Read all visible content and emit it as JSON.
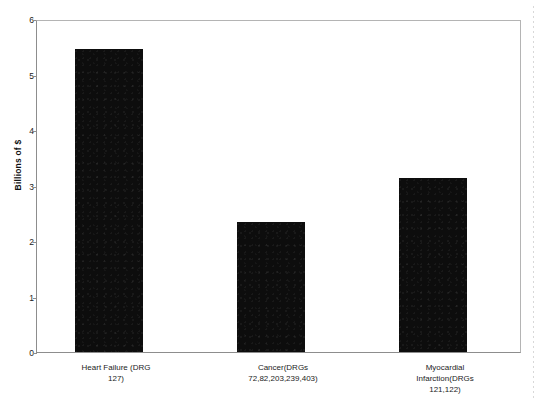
{
  "chart_data": {
    "type": "bar",
    "title": "",
    "subtitle": "",
    "xlabel": "",
    "ylabel": "Billions of $",
    "ylim": [
      0,
      6
    ],
    "yticks": [
      "0",
      "1",
      "2",
      "3",
      "4",
      "5",
      "6"
    ],
    "grid": false,
    "legend": null,
    "categories": [
      "Heart Failure (DRG\n127)",
      "Cancer(DRGs\n72,82,203,239,403)",
      "Myocardial\nInfarction(DRGs\n121,122)"
    ],
    "values": [
      5.5,
      2.35,
      3.15
    ],
    "series": [
      {
        "name": "Spending",
        "color": "#0d0d0d",
        "values": [
          5.5,
          2.35,
          3.15
        ]
      }
    ],
    "annotations": []
  },
  "axis": {
    "y_title": "Billions of $",
    "tick_0": "0",
    "tick_1": "1",
    "tick_2": "2",
    "tick_3": "3",
    "tick_4": "4",
    "tick_5": "5",
    "tick_6": "6"
  },
  "xlabels": {
    "bar1": "Heart Failure (DRG\n127)",
    "bar2": "Cancer(DRGs\n72,82,203,239,403)",
    "bar3": "Myocardial\nInfarction(DRGs\n121,122)"
  }
}
